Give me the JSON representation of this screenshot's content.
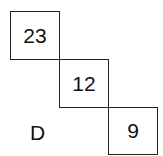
{
  "diagram": {
    "boxes": [
      {
        "value": "23"
      },
      {
        "value": "12"
      },
      {
        "value": "9"
      }
    ],
    "label": "D"
  }
}
